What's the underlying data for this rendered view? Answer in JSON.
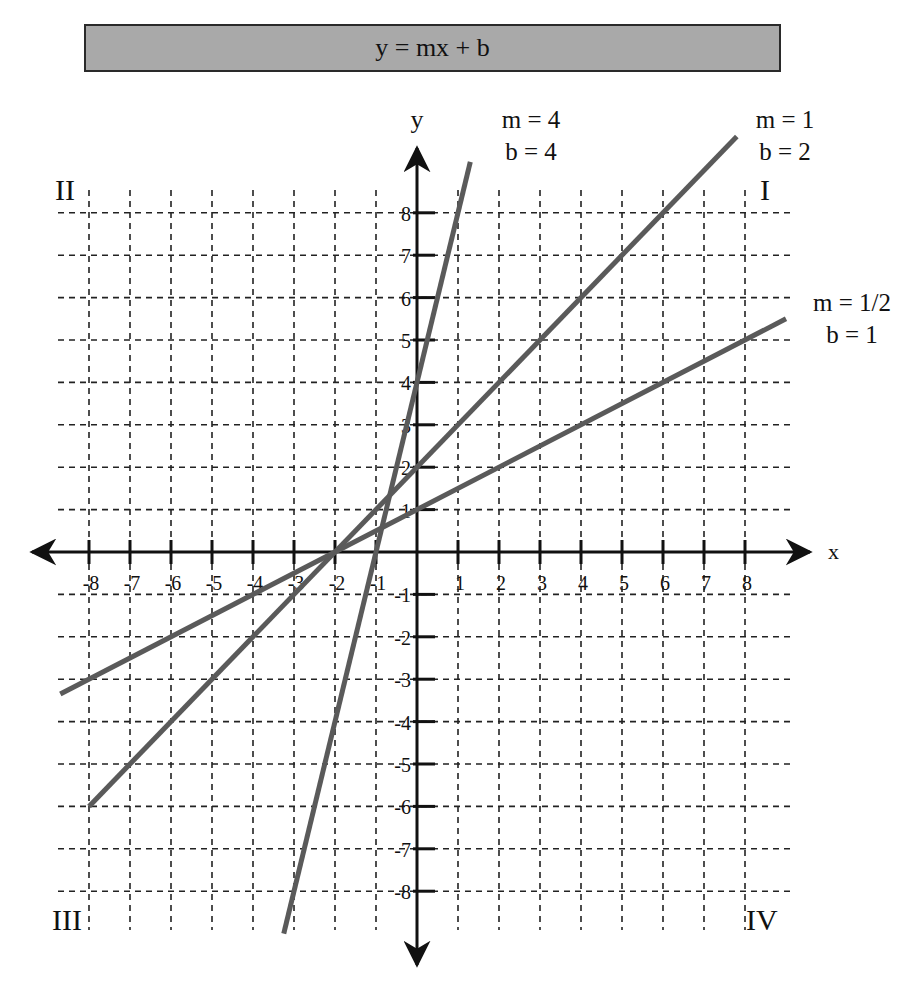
{
  "title": "y = mx + b",
  "axes": {
    "x_label": "x",
    "y_label": "y",
    "x_ticks": [
      "-8",
      "-7",
      "-6",
      "-5",
      "-4",
      "-3",
      "-2",
      "-1",
      "1",
      "2",
      "3",
      "4",
      "5",
      "6",
      "7",
      "8"
    ],
    "y_ticks": [
      "8",
      "7",
      "6",
      "5",
      "4",
      "3",
      "2",
      "1",
      "-1",
      "-2",
      "-3",
      "-4",
      "-5",
      "-6",
      "-7",
      "-8"
    ]
  },
  "quadrants": {
    "q1": "I",
    "q2": "II",
    "q3": "III",
    "q4": "IV"
  },
  "line_labels": [
    {
      "m": "m = 4",
      "b": "b = 4"
    },
    {
      "m": "m = 1",
      "b": "b = 2"
    },
    {
      "m": "m = 1/2",
      "b": "b = 1"
    }
  ],
  "colors": {
    "line": "#5a5a5a",
    "axis": "#111111",
    "grid": "#222222",
    "title_bg": "#a9a9a9"
  },
  "chart_data": {
    "type": "line",
    "title": "y = mx + b",
    "xlabel": "x",
    "ylabel": "y",
    "xlim": [
      -9,
      9
    ],
    "ylim": [
      -9,
      9
    ],
    "grid": true,
    "grid_style": "dashed",
    "x_ticks": [
      -8,
      -7,
      -6,
      -5,
      -4,
      -3,
      -2,
      -1,
      1,
      2,
      3,
      4,
      5,
      6,
      7,
      8
    ],
    "y_ticks": [
      -8,
      -7,
      -6,
      -5,
      -4,
      -3,
      -2,
      -1,
      1,
      2,
      3,
      4,
      5,
      6,
      7,
      8
    ],
    "annotations": [
      "I",
      "II",
      "III",
      "IV"
    ],
    "series": [
      {
        "name": "m = 4, b = 4",
        "slope": 4,
        "intercept": 4,
        "x": [
          -3.25,
          1.3
        ],
        "y": [
          -9,
          9.2
        ]
      },
      {
        "name": "m = 1, b = 2",
        "slope": 1,
        "intercept": 2,
        "x": [
          -8,
          7.8
        ],
        "y": [
          -6,
          9.8
        ]
      },
      {
        "name": "m = 1/2, b = 1",
        "slope": 0.5,
        "intercept": 1,
        "x": [
          -8.7,
          9
        ],
        "y": [
          -3.35,
          5.5
        ]
      }
    ],
    "intersection_point": {
      "x": -2,
      "y": 0
    }
  }
}
